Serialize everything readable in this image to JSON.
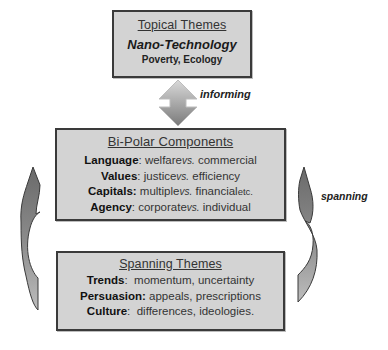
{
  "topical": {
    "title": "Topical Themes",
    "headline": "Nano-Technology",
    "subtitle": "Poverty, Ecology"
  },
  "connectors": {
    "informing": "informing",
    "spanning": "spanning"
  },
  "bipolar": {
    "title": "Bi-Polar Components",
    "rows": [
      {
        "label": "Language",
        "sep": ": ",
        "left": "welfare",
        "vs": "vs.",
        "right": " commercial",
        "extra": ""
      },
      {
        "label": "Values",
        "sep": ": ",
        "left": "justice",
        "vs": "vs.",
        "right": " efficiency",
        "extra": ""
      },
      {
        "label": "Capitals:",
        "sep": " ",
        "left": "multiple",
        "vs": "vs.",
        "right": " financial",
        "extra": "etc."
      },
      {
        "label": "Agency",
        "sep": ": ",
        "left": "corporate",
        "vs": "vs.",
        "right": " individual",
        "extra": ""
      }
    ]
  },
  "spanning": {
    "title": "Spanning Themes",
    "rows": [
      {
        "label": "Trends",
        "sep": ":  ",
        "value": "momentum, uncertainty"
      },
      {
        "label": "Persuasion:",
        "sep": " ",
        "value": "appeals, prescriptions"
      },
      {
        "label": "Culture",
        "sep": ":  ",
        "value": "differences, ideologies."
      }
    ]
  },
  "colors": {
    "box_fill": "#d3d3d3",
    "box_border": "#3a3a3a",
    "arrow_light": "#d0d0d0",
    "arrow_dark": "#6e6e6e"
  }
}
